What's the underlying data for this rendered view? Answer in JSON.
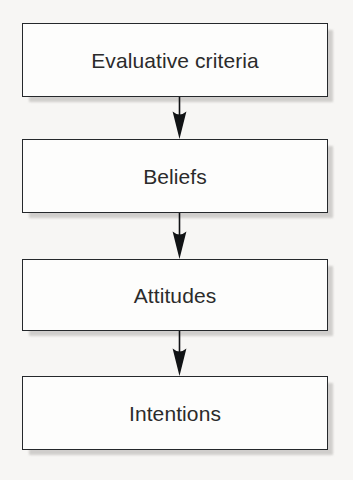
{
  "diagram": {
    "type": "flowchart",
    "orientation": "vertical",
    "title": "",
    "background_color": "#f7f6f4",
    "box_fill_color": "#fdfdfc",
    "box_border_color": "#25282b",
    "text_color": "#2b2b2b",
    "shadow_color": "#b9b7b4",
    "arrow_color": "#111315",
    "nodes": [
      {
        "id": "evaluative-criteria",
        "label": "Evaluative criteria",
        "order": 1
      },
      {
        "id": "beliefs",
        "label": "Beliefs",
        "order": 2
      },
      {
        "id": "attitudes",
        "label": "Attitudes",
        "order": 3
      },
      {
        "id": "intentions",
        "label": "Intentions",
        "order": 4
      }
    ],
    "edges": [
      {
        "id": "edge-1",
        "from": "evaluative-criteria",
        "to": "beliefs",
        "arrow": "down"
      },
      {
        "id": "edge-2",
        "from": "beliefs",
        "to": "attitudes",
        "arrow": "down"
      },
      {
        "id": "edge-3",
        "from": "attitudes",
        "to": "intentions",
        "arrow": "down"
      }
    ]
  }
}
